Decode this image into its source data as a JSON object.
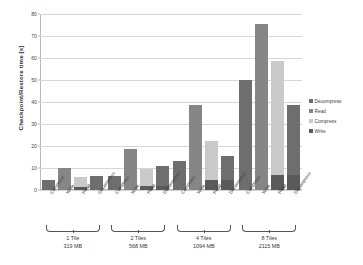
{
  "chart_data": {
    "type": "bar",
    "title": "",
    "xlabel": "",
    "ylabel": "Checkpoint/Restore time [s]",
    "ylim": [
      0,
      80
    ],
    "yticks": [
      0,
      10,
      20,
      30,
      40,
      50,
      60,
      70,
      80
    ],
    "grid": true,
    "legend_position": "right",
    "stacked": true,
    "orientation": "vertical",
    "categories": [
      "1 Tile",
      "2 Tiles",
      "4 Tiles",
      "8 Tiles"
    ],
    "category_sublabels": [
      "319 MB",
      "568 MB",
      "1094 MB",
      "2115 MB"
    ],
    "bar_labels": [
      "Compress",
      "Write",
      "Read",
      "Decompress"
    ],
    "legend": [
      {
        "name": "Decompress",
        "color": "#6e6e6e"
      },
      {
        "name": "Read",
        "color": "#868686"
      },
      {
        "name": "Compress",
        "color": "#c9c9c9"
      },
      {
        "name": "Write",
        "color": "#5a5a5a"
      }
    ],
    "groups": [
      {
        "category": "1 Tile",
        "size": "319 MB",
        "bars": [
          {
            "label": "Compress",
            "total": 4.6,
            "segments": [
              {
                "name": "Compress",
                "value": 4.6,
                "color": "#6e6e6e"
              }
            ]
          },
          {
            "label": "Write",
            "total": 10.0,
            "segments": [
              {
                "name": "Write",
                "value": 10.0,
                "color": "#868686"
              }
            ]
          },
          {
            "label": "Read",
            "total": 6.0,
            "segments": [
              {
                "name": "Read",
                "value": 4.6,
                "color": "#c9c9c9"
              },
              {
                "name": "base",
                "value": 1.4,
                "color": "#5a5a5a"
              }
            ]
          },
          {
            "label": "Decompress",
            "total": 6.3,
            "segments": [
              {
                "name": "Decompress",
                "value": 6.3,
                "color": "#6e6e6e"
              }
            ]
          }
        ]
      },
      {
        "category": "2 Tiles",
        "size": "568 MB",
        "bars": [
          {
            "label": "Compress",
            "total": 6.3,
            "segments": [
              {
                "name": "Compress",
                "value": 6.3,
                "color": "#6e6e6e"
              }
            ]
          },
          {
            "label": "Write",
            "total": 18.6,
            "segments": [
              {
                "name": "Write",
                "value": 18.6,
                "color": "#868686"
              }
            ]
          },
          {
            "label": "Read",
            "total": 9.4,
            "segments": [
              {
                "name": "Read",
                "value": 7.4,
                "color": "#c9c9c9"
              },
              {
                "name": "base",
                "value": 2.0,
                "color": "#5a5a5a"
              }
            ]
          },
          {
            "label": "Decompress",
            "total": 11.0,
            "segments": [
              {
                "name": "Decompress",
                "value": 9.2,
                "color": "#6e6e6e"
              },
              {
                "name": "base",
                "value": 1.8,
                "color": "#5a5a5a"
              }
            ]
          }
        ]
      },
      {
        "category": "4 Tiles",
        "size": "1094 MB",
        "bars": [
          {
            "label": "Compress",
            "total": 13.0,
            "segments": [
              {
                "name": "Compress",
                "value": 13.0,
                "color": "#6e6e6e"
              }
            ]
          },
          {
            "label": "Write",
            "total": 38.8,
            "segments": [
              {
                "name": "Write",
                "value": 38.8,
                "color": "#868686"
              }
            ]
          },
          {
            "label": "Read",
            "total": 22.5,
            "segments": [
              {
                "name": "Read",
                "value": 18.0,
                "color": "#c9c9c9"
              },
              {
                "name": "base",
                "value": 4.5,
                "color": "#5a5a5a"
              }
            ]
          },
          {
            "label": "Decompress",
            "total": 15.5,
            "segments": [
              {
                "name": "Decompress",
                "value": 11.0,
                "color": "#6e6e6e"
              },
              {
                "name": "base",
                "value": 4.5,
                "color": "#5a5a5a"
              }
            ]
          }
        ]
      },
      {
        "category": "8 Tiles",
        "size": "2115 MB",
        "bars": [
          {
            "label": "Compress",
            "total": 50.0,
            "segments": [
              {
                "name": "Compress",
                "value": 50.0,
                "color": "#6e6e6e"
              }
            ]
          },
          {
            "label": "Write",
            "total": 75.5,
            "segments": [
              {
                "name": "Write",
                "value": 75.5,
                "color": "#868686"
              }
            ]
          },
          {
            "label": "Read",
            "total": 58.5,
            "segments": [
              {
                "name": "Read",
                "value": 51.5,
                "color": "#c9c9c9"
              },
              {
                "name": "base",
                "value": 7.0,
                "color": "#5a5a5a"
              }
            ]
          },
          {
            "label": "Decompress",
            "total": 38.8,
            "segments": [
              {
                "name": "Decompress",
                "value": 31.8,
                "color": "#6e6e6e"
              },
              {
                "name": "base",
                "value": 7.0,
                "color": "#5a5a5a"
              }
            ]
          }
        ]
      }
    ]
  }
}
